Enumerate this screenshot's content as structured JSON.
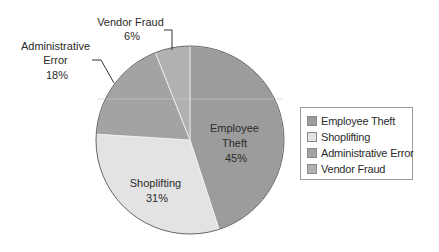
{
  "chart_data": {
    "type": "pie",
    "title": "",
    "categories": [
      "Employee Theft",
      "Shoplifting",
      "Administrative Error",
      "Vendor Fraud"
    ],
    "values": [
      45,
      31,
      18,
      6
    ],
    "unit": "%",
    "colors": [
      "#9c9c9c",
      "#e3e3e3",
      "#a3a3a3",
      "#b1b1b1"
    ],
    "start_angle_deg": 0,
    "direction": "clockwise",
    "legend_position": "right",
    "labels": [
      {
        "lines": [
          "Employee",
          "Theft",
          "45%"
        ],
        "placement": "inside"
      },
      {
        "lines": [
          "Shoplifting",
          "31%"
        ],
        "placement": "inside"
      },
      {
        "lines": [
          "Administrative",
          "Error",
          "18%"
        ],
        "placement": "outside-leader"
      },
      {
        "lines": [
          "Vendor Fraud",
          "6%"
        ],
        "placement": "outside-leader"
      }
    ]
  },
  "legend": {
    "items": [
      {
        "label": "Employee Theft",
        "color": "#9c9c9c"
      },
      {
        "label": "Shoplifting",
        "color": "#e3e3e3"
      },
      {
        "label": "Administrative Error",
        "color": "#a3a3a3"
      },
      {
        "label": "Vendor Fraud",
        "color": "#b1b1b1"
      }
    ]
  }
}
